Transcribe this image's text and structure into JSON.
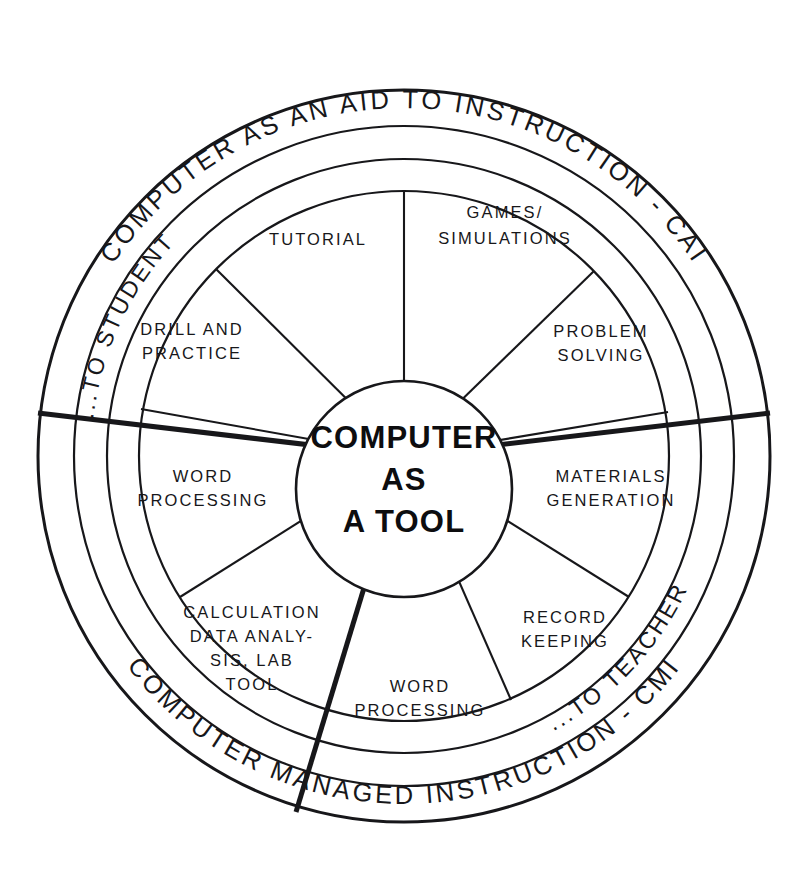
{
  "diagram": {
    "hub": {
      "line1": "COMPUTER",
      "line2": "AS",
      "line3": "A TOOL"
    },
    "outer_ring": {
      "top_label": "COMPUTER AS AN AID TO INSTRUCTION - CAI",
      "bottom_label": "COMPUTER MANAGED INSTRUCTION - CMI"
    },
    "middle_ring": {
      "left_label": "...TO STUDENT",
      "right_label": "...TO TEACHER"
    },
    "sectors": [
      {
        "id": "tutorial",
        "lines": [
          "TUTORIAL"
        ]
      },
      {
        "id": "games-simulations",
        "lines": [
          "GAMES/",
          "SIMULATIONS"
        ]
      },
      {
        "id": "problem-solving",
        "lines": [
          "PROBLEM",
          "SOLVING"
        ]
      },
      {
        "id": "drill-and-practice",
        "lines": [
          "DRILL AND",
          "PRACTICE"
        ]
      },
      {
        "id": "word-processing-left",
        "lines": [
          "WORD",
          "PROCESSING"
        ]
      },
      {
        "id": "materials-generation",
        "lines": [
          "MATERIALS",
          "GENERATION"
        ]
      },
      {
        "id": "calculation-data-analysis",
        "lines": [
          "CALCULATION",
          "DATA ANALY-",
          "SIS, LAB",
          "TOOL"
        ]
      },
      {
        "id": "word-processing-bottom",
        "lines": [
          "WORD",
          "PROCESSING"
        ]
      },
      {
        "id": "record-keeping",
        "lines": [
          "RECORD",
          "KEEPING"
        ]
      }
    ],
    "colors": {
      "ink": "#17171a",
      "background": "#ffffff"
    }
  }
}
